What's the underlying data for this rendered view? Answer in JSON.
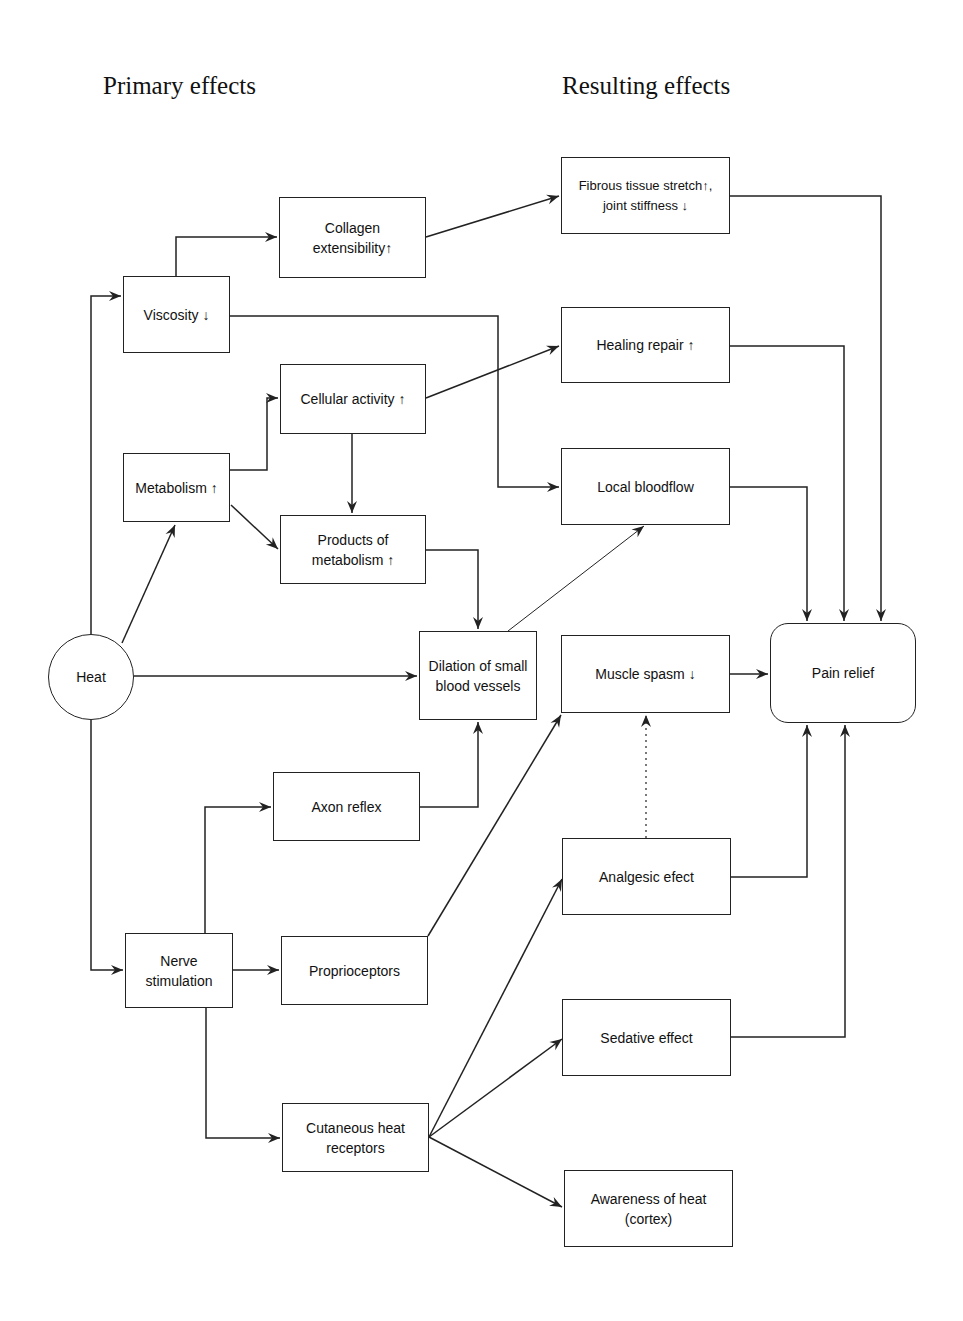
{
  "diagram": {
    "titles": {
      "primary": "Primary effects",
      "resulting": "Resulting effects"
    },
    "nodes": {
      "heat": "Heat",
      "viscosity": "Viscosity ↓",
      "metabolism": "Metabolism ↑",
      "nerve_stimulation": "Nerve\nstimulation",
      "collagen": "Collagen\nextensibility↑",
      "cellular_activity": "Cellular activity ↑",
      "products_metabolism": "Products of\nmetabolism ↑",
      "dilation": "Dilation of small\nblood vessels",
      "axon_reflex": "Axon reflex",
      "proprioceptors": "Proprioceptors",
      "cutaneous": "Cutaneous heat\nreceptors",
      "fibrous": "Fibrous tissue stretch↑,\njoint stiffness ↓",
      "healing": "Healing repair ↑",
      "local_bloodflow": "Local bloodflow",
      "muscle_spasm": "Muscle spasm ↓",
      "analgesic": "Analgesic efect",
      "sedative": "Sedative effect",
      "awareness": "Awareness of heat\n(cortex)",
      "pain_relief": "Pain relief"
    },
    "edges": [
      {
        "from": "heat",
        "to": "viscosity"
      },
      {
        "from": "heat",
        "to": "metabolism"
      },
      {
        "from": "heat",
        "to": "dilation"
      },
      {
        "from": "heat",
        "to": "nerve_stimulation"
      },
      {
        "from": "viscosity",
        "to": "collagen"
      },
      {
        "from": "viscosity",
        "to": "local_bloodflow"
      },
      {
        "from": "collagen",
        "to": "fibrous"
      },
      {
        "from": "metabolism",
        "to": "cellular_activity"
      },
      {
        "from": "metabolism",
        "to": "products_metabolism"
      },
      {
        "from": "cellular_activity",
        "to": "products_metabolism"
      },
      {
        "from": "cellular_activity",
        "to": "healing"
      },
      {
        "from": "products_metabolism",
        "to": "dilation"
      },
      {
        "from": "dilation",
        "to": "local_bloodflow"
      },
      {
        "from": "nerve_stimulation",
        "to": "axon_reflex"
      },
      {
        "from": "nerve_stimulation",
        "to": "proprioceptors"
      },
      {
        "from": "nerve_stimulation",
        "to": "cutaneous"
      },
      {
        "from": "axon_reflex",
        "to": "dilation"
      },
      {
        "from": "proprioceptors",
        "to": "muscle_spasm"
      },
      {
        "from": "cutaneous",
        "to": "analgesic"
      },
      {
        "from": "cutaneous",
        "to": "sedative"
      },
      {
        "from": "cutaneous",
        "to": "awareness"
      },
      {
        "from": "analgesic",
        "to": "muscle_spasm",
        "style": "dotted"
      },
      {
        "from": "fibrous",
        "to": "pain_relief"
      },
      {
        "from": "healing",
        "to": "pain_relief"
      },
      {
        "from": "local_bloodflow",
        "to": "pain_relief"
      },
      {
        "from": "muscle_spasm",
        "to": "pain_relief"
      },
      {
        "from": "analgesic",
        "to": "pain_relief"
      },
      {
        "from": "sedative",
        "to": "pain_relief"
      }
    ]
  }
}
